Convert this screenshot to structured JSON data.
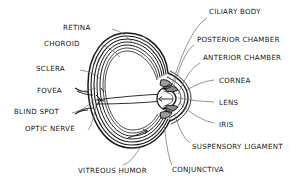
{
  "diagram": {
    "style": {
      "background": "#ffffff",
      "ink": "#1a1a1a",
      "fill_shade": "#b0b0b0"
    },
    "labels": [
      {
        "id": "retina",
        "text": "RETINA",
        "x": 63,
        "y": 29,
        "align": "right",
        "anchor_x": 112,
        "anchor_y": 29,
        "tip_x": 133,
        "tip_y": 43
      },
      {
        "id": "choroid",
        "text": "CHOROID",
        "x": 44,
        "y": 45,
        "align": "right",
        "anchor_x": 100,
        "anchor_y": 45,
        "tip_x": 120,
        "tip_y": 57
      },
      {
        "id": "sclera",
        "text": "SCLERA",
        "x": 36,
        "y": 70,
        "align": "right",
        "anchor_x": 80,
        "anchor_y": 70,
        "tip_x": 101,
        "tip_y": 79
      },
      {
        "id": "fovea",
        "text": "FOVEA",
        "x": 37,
        "y": 92,
        "align": "right",
        "anchor_x": 78,
        "anchor_y": 92,
        "tip_x": 96,
        "tip_y": 88
      },
      {
        "id": "blind-spot",
        "text": "BLIND SPOT",
        "x": 14,
        "y": 113,
        "align": "right",
        "anchor_x": 72,
        "anchor_y": 113,
        "tip_x": 95,
        "tip_y": 99
      },
      {
        "id": "optic-nerve",
        "text": "OPTIC NERVE",
        "x": 25,
        "y": 130,
        "align": "right",
        "anchor_x": 88,
        "anchor_y": 130,
        "tip_x": 96,
        "tip_y": 106
      },
      {
        "id": "vitreous-humor",
        "text": "VITREOUS HUMOR",
        "x": 78,
        "y": 172,
        "align": "left",
        "anchor_x": 123,
        "anchor_y": 165,
        "tip_x": 141,
        "tip_y": 146
      },
      {
        "id": "ciliary-body",
        "text": "CILIARY BODY",
        "x": 209,
        "y": 13,
        "align": "left",
        "anchor_x": 207,
        "anchor_y": 18,
        "tip_x": 172,
        "tip_y": 85
      },
      {
        "id": "posterior-chamber",
        "text": "POSTERIOR CHAMBER",
        "x": 197,
        "y": 41,
        "align": "left",
        "anchor_x": 194,
        "anchor_y": 45,
        "tip_x": 172,
        "tip_y": 92
      },
      {
        "id": "anterior-chamber",
        "text": "ANTERIOR CHAMBER",
        "x": 203,
        "y": 59,
        "align": "left",
        "anchor_x": 200,
        "anchor_y": 63,
        "tip_x": 178,
        "tip_y": 94
      },
      {
        "id": "cornea",
        "text": "CORNEA",
        "x": 219,
        "y": 82,
        "align": "left",
        "anchor_x": 214,
        "anchor_y": 80,
        "tip_x": 187,
        "tip_y": 90
      },
      {
        "id": "lens",
        "text": "LENS",
        "x": 219,
        "y": 104,
        "align": "left",
        "anchor_x": 214,
        "anchor_y": 102,
        "tip_x": 178,
        "tip_y": 98
      },
      {
        "id": "iris",
        "text": "IRIS",
        "x": 219,
        "y": 126,
        "align": "left",
        "anchor_x": 214,
        "anchor_y": 123,
        "tip_x": 180,
        "tip_y": 103
      },
      {
        "id": "suspensory-ligament",
        "text": "SUSPENSORY LIGAMENT",
        "x": 192,
        "y": 148,
        "align": "left",
        "anchor_x": 190,
        "anchor_y": 143,
        "tip_x": 174,
        "tip_y": 113
      },
      {
        "id": "conjunctiva",
        "text": "CONJUNCTIVA",
        "x": 172,
        "y": 171,
        "align": "left",
        "anchor_x": 172,
        "anchor_y": 165,
        "tip_x": 164,
        "tip_y": 124
      }
    ]
  }
}
